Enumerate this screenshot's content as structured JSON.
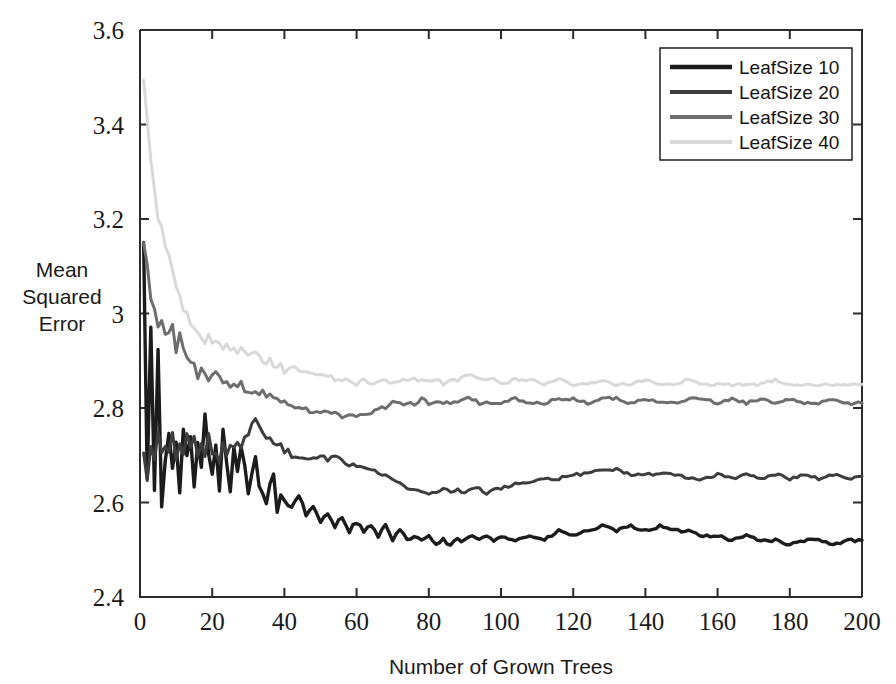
{
  "chart_data": {
    "type": "line",
    "title": "",
    "xlabel": "Number of Grown Trees",
    "ylabel": "Mean Squared Error",
    "ylabel_lines": [
      "Mean",
      "Squared",
      "Error"
    ],
    "xlim": [
      0,
      200
    ],
    "ylim": [
      2.4,
      3.6
    ],
    "xticks": [
      0,
      20,
      40,
      60,
      80,
      100,
      120,
      140,
      160,
      180,
      200
    ],
    "xtick_labels": [
      "0",
      "20",
      "40",
      "60",
      "80",
      "100",
      "120",
      "140",
      "160",
      "180",
      "200"
    ],
    "yticks": [
      2.4,
      2.6,
      2.8,
      3.0,
      3.2,
      3.4,
      3.6
    ],
    "ytick_labels": [
      "2.4",
      "2.6",
      "2.8",
      "3",
      "3.2",
      "3.4",
      "3.6"
    ],
    "grid": false,
    "legend_position": "top-right",
    "legend_entries": [
      "LeafSize 10",
      "LeafSize 20",
      "LeafSize 30",
      "LeafSize 40"
    ],
    "series": [
      {
        "name": "LeafSize 10",
        "color": "#1c1c1c",
        "linewidth": 3.4,
        "final_value": 2.52,
        "x": [
          1,
          2,
          3,
          4,
          5,
          6,
          7,
          8,
          9,
          10,
          11,
          12,
          13,
          14,
          15,
          16,
          17,
          18,
          19,
          20,
          21,
          22,
          23,
          24,
          25,
          26,
          27,
          28,
          29,
          30,
          31,
          32,
          33,
          34,
          35,
          36,
          37,
          38,
          39,
          40,
          42,
          44,
          46,
          48,
          50,
          52,
          54,
          56,
          58,
          60,
          62,
          64,
          66,
          68,
          70,
          72,
          74,
          76,
          78,
          80,
          82,
          84,
          86,
          88,
          90,
          92,
          94,
          96,
          98,
          100,
          104,
          108,
          112,
          116,
          120,
          124,
          128,
          132,
          136,
          140,
          144,
          148,
          152,
          156,
          160,
          164,
          168,
          172,
          176,
          180,
          184,
          188,
          192,
          196,
          200
        ],
        "values": [
          3.14,
          2.66,
          2.98,
          2.62,
          2.92,
          2.6,
          2.7,
          2.74,
          2.66,
          2.74,
          2.62,
          2.74,
          2.69,
          2.74,
          2.62,
          2.73,
          2.66,
          2.78,
          2.7,
          2.66,
          2.72,
          2.63,
          2.75,
          2.68,
          2.63,
          2.71,
          2.66,
          2.72,
          2.68,
          2.62,
          2.66,
          2.7,
          2.64,
          2.62,
          2.6,
          2.64,
          2.66,
          2.58,
          2.62,
          2.6,
          2.59,
          2.62,
          2.57,
          2.59,
          2.56,
          2.58,
          2.55,
          2.57,
          2.54,
          2.56,
          2.54,
          2.55,
          2.53,
          2.55,
          2.52,
          2.54,
          2.52,
          2.53,
          2.52,
          2.53,
          2.51,
          2.52,
          2.51,
          2.52,
          2.52,
          2.53,
          2.52,
          2.53,
          2.52,
          2.53,
          2.52,
          2.53,
          2.52,
          2.54,
          2.53,
          2.54,
          2.55,
          2.54,
          2.55,
          2.54,
          2.55,
          2.54,
          2.54,
          2.53,
          2.53,
          2.52,
          2.53,
          2.52,
          2.52,
          2.51,
          2.52,
          2.52,
          2.51,
          2.52,
          2.52
        ]
      },
      {
        "name": "LeafSize 20",
        "color": "#3d3d3d",
        "linewidth": 3.0,
        "final_value": 2.655,
        "x": [
          1,
          2,
          3,
          4,
          5,
          6,
          7,
          8,
          9,
          10,
          11,
          12,
          13,
          14,
          15,
          16,
          17,
          18,
          19,
          20,
          21,
          22,
          23,
          24,
          25,
          26,
          27,
          28,
          29,
          30,
          31,
          32,
          33,
          34,
          35,
          36,
          37,
          38,
          39,
          40,
          42,
          44,
          46,
          48,
          50,
          52,
          54,
          56,
          58,
          60,
          62,
          64,
          66,
          68,
          70,
          72,
          74,
          76,
          78,
          80,
          82,
          84,
          86,
          88,
          90,
          92,
          94,
          96,
          98,
          100,
          104,
          108,
          112,
          116,
          120,
          124,
          128,
          132,
          136,
          140,
          144,
          148,
          152,
          156,
          160,
          164,
          168,
          172,
          176,
          180,
          184,
          188,
          192,
          196,
          200
        ],
        "values": [
          2.7,
          2.66,
          2.72,
          2.68,
          2.74,
          2.7,
          2.73,
          2.71,
          2.74,
          2.7,
          2.73,
          2.69,
          2.74,
          2.72,
          2.74,
          2.7,
          2.73,
          2.71,
          2.74,
          2.7,
          2.71,
          2.69,
          2.72,
          2.7,
          2.72,
          2.71,
          2.73,
          2.72,
          2.74,
          2.75,
          2.76,
          2.77,
          2.76,
          2.75,
          2.74,
          2.74,
          2.73,
          2.72,
          2.72,
          2.71,
          2.7,
          2.7,
          2.69,
          2.69,
          2.7,
          2.69,
          2.7,
          2.69,
          2.68,
          2.68,
          2.67,
          2.67,
          2.66,
          2.66,
          2.65,
          2.64,
          2.63,
          2.63,
          2.62,
          2.62,
          2.62,
          2.63,
          2.62,
          2.63,
          2.62,
          2.63,
          2.63,
          2.62,
          2.63,
          2.63,
          2.64,
          2.64,
          2.65,
          2.65,
          2.66,
          2.66,
          2.67,
          2.67,
          2.66,
          2.66,
          2.66,
          2.66,
          2.65,
          2.65,
          2.66,
          2.65,
          2.66,
          2.65,
          2.66,
          2.65,
          2.66,
          2.65,
          2.66,
          2.65,
          2.655
        ]
      },
      {
        "name": "LeafSize 30",
        "color": "#6e6e6e",
        "linewidth": 3.0,
        "final_value": 2.81,
        "x": [
          1,
          2,
          3,
          4,
          5,
          6,
          7,
          8,
          9,
          10,
          11,
          12,
          13,
          14,
          15,
          16,
          17,
          18,
          19,
          20,
          21,
          22,
          23,
          24,
          25,
          26,
          27,
          28,
          29,
          30,
          31,
          32,
          33,
          34,
          35,
          36,
          37,
          38,
          39,
          40,
          42,
          44,
          46,
          48,
          50,
          52,
          54,
          56,
          58,
          60,
          62,
          64,
          66,
          68,
          70,
          72,
          74,
          76,
          78,
          80,
          82,
          84,
          86,
          88,
          90,
          92,
          94,
          96,
          98,
          100,
          104,
          108,
          112,
          116,
          120,
          124,
          128,
          132,
          136,
          140,
          144,
          148,
          152,
          156,
          160,
          164,
          168,
          172,
          176,
          180,
          184,
          188,
          192,
          196,
          200
        ],
        "values": [
          3.15,
          3.09,
          3.04,
          3.0,
          2.98,
          3.0,
          2.97,
          2.95,
          2.98,
          2.93,
          2.96,
          2.92,
          2.9,
          2.91,
          2.88,
          2.87,
          2.89,
          2.86,
          2.86,
          2.87,
          2.88,
          2.86,
          2.85,
          2.86,
          2.85,
          2.85,
          2.84,
          2.85,
          2.84,
          2.84,
          2.83,
          2.84,
          2.83,
          2.83,
          2.82,
          2.83,
          2.82,
          2.82,
          2.81,
          2.81,
          2.8,
          2.8,
          2.8,
          2.79,
          2.79,
          2.79,
          2.79,
          2.78,
          2.79,
          2.78,
          2.79,
          2.79,
          2.8,
          2.8,
          2.81,
          2.81,
          2.81,
          2.81,
          2.82,
          2.81,
          2.81,
          2.81,
          2.81,
          2.81,
          2.82,
          2.82,
          2.81,
          2.81,
          2.81,
          2.81,
          2.82,
          2.81,
          2.81,
          2.82,
          2.82,
          2.81,
          2.82,
          2.82,
          2.81,
          2.82,
          2.81,
          2.81,
          2.82,
          2.82,
          2.81,
          2.82,
          2.81,
          2.82,
          2.81,
          2.82,
          2.81,
          2.81,
          2.82,
          2.81,
          2.81
        ]
      },
      {
        "name": "LeafSize 40",
        "color": "#d9d9d9",
        "linewidth": 3.0,
        "final_value": 2.85,
        "x": [
          1,
          2,
          3,
          4,
          5,
          6,
          7,
          8,
          9,
          10,
          11,
          12,
          13,
          14,
          15,
          16,
          17,
          18,
          19,
          20,
          21,
          22,
          23,
          24,
          25,
          26,
          27,
          28,
          29,
          30,
          31,
          32,
          33,
          34,
          35,
          36,
          37,
          38,
          39,
          40,
          42,
          44,
          46,
          48,
          50,
          52,
          54,
          56,
          58,
          60,
          62,
          64,
          66,
          68,
          70,
          72,
          74,
          76,
          78,
          80,
          82,
          84,
          86,
          88,
          90,
          92,
          94,
          96,
          98,
          100,
          104,
          108,
          112,
          116,
          120,
          124,
          128,
          132,
          136,
          140,
          144,
          148,
          152,
          156,
          160,
          164,
          168,
          172,
          176,
          180,
          184,
          188,
          192,
          196,
          200
        ],
        "values": [
          3.5,
          3.4,
          3.32,
          3.26,
          3.21,
          3.17,
          3.14,
          3.11,
          3.08,
          3.06,
          3.04,
          3.02,
          3.01,
          2.99,
          2.98,
          2.97,
          2.96,
          2.95,
          2.95,
          2.94,
          2.94,
          2.93,
          2.93,
          2.94,
          2.93,
          2.92,
          2.92,
          2.93,
          2.92,
          2.91,
          2.91,
          2.92,
          2.91,
          2.9,
          2.9,
          2.9,
          2.89,
          2.89,
          2.89,
          2.88,
          2.88,
          2.88,
          2.88,
          2.87,
          2.87,
          2.87,
          2.86,
          2.86,
          2.86,
          2.85,
          2.86,
          2.85,
          2.86,
          2.86,
          2.85,
          2.86,
          2.86,
          2.86,
          2.86,
          2.86,
          2.86,
          2.85,
          2.86,
          2.86,
          2.87,
          2.87,
          2.86,
          2.86,
          2.86,
          2.85,
          2.86,
          2.86,
          2.85,
          2.86,
          2.85,
          2.85,
          2.86,
          2.85,
          2.85,
          2.86,
          2.85,
          2.85,
          2.86,
          2.85,
          2.85,
          2.85,
          2.85,
          2.85,
          2.86,
          2.85,
          2.85,
          2.85,
          2.85,
          2.85,
          2.85
        ]
      }
    ]
  }
}
